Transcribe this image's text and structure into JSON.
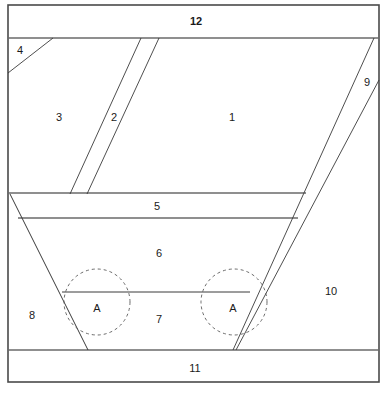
{
  "diagram": {
    "type": "line-diagram",
    "background_color": "#ffffff",
    "line_color": "#3a3a3a",
    "frame_color": "#4a4a4a",
    "dashed_color": "#5a5a5a",
    "labels": [
      {
        "id": "label-12",
        "text": "12",
        "x": 196,
        "y": 22
      },
      {
        "id": "label-4",
        "text": "4",
        "x": 20,
        "y": 51
      },
      {
        "id": "label-3",
        "text": "3",
        "x": 59,
        "y": 118
      },
      {
        "id": "label-2",
        "text": "2",
        "x": 114,
        "y": 118
      },
      {
        "id": "label-1",
        "text": "1",
        "x": 232,
        "y": 118
      },
      {
        "id": "label-9",
        "text": "9",
        "x": 367,
        "y": 83
      },
      {
        "id": "label-5",
        "text": "5",
        "x": 157,
        "y": 207
      },
      {
        "id": "label-6",
        "text": "6",
        "x": 159,
        "y": 254
      },
      {
        "id": "label-10",
        "text": "10",
        "x": 331,
        "y": 292
      },
      {
        "id": "label-A-left",
        "text": "A",
        "x": 97,
        "y": 309
      },
      {
        "id": "label-8",
        "text": "8",
        "x": 32,
        "y": 316
      },
      {
        "id": "label-7",
        "text": "7",
        "x": 159,
        "y": 320
      },
      {
        "id": "label-A-right",
        "text": "A",
        "x": 233,
        "y": 309
      },
      {
        "id": "label-11",
        "text": "11",
        "x": 195,
        "y": 369
      }
    ],
    "frame": {
      "name": "outer-border",
      "x": 8,
      "y": 5,
      "width": 371,
      "height": 377
    },
    "horizontals": [
      {
        "id": "top-band-divider",
        "x1": 8,
        "y1": 38,
        "x2": 379,
        "y2": 38
      },
      {
        "id": "mid-upper-divider",
        "x1": 8,
        "y1": 193,
        "x2": 305,
        "y2": 193
      },
      {
        "id": "band-5-lower",
        "x1": 18,
        "y1": 218,
        "x2": 297,
        "y2": 218
      },
      {
        "id": "band-6-lower",
        "x1": 62,
        "y1": 292,
        "x2": 250,
        "y2": 292
      },
      {
        "id": "bottom-band-divider",
        "x1": 8,
        "y1": 350,
        "x2": 379,
        "y2": 350
      }
    ],
    "diagonals": [
      {
        "id": "line-4-hypotenuse",
        "x1": 53,
        "y1": 38,
        "x2": 8,
        "y2": 73
      },
      {
        "id": "strip-2-left",
        "x1": 141,
        "y1": 38,
        "x2": 70,
        "y2": 193
      },
      {
        "id": "strip-2-right",
        "x1": 159,
        "y1": 38,
        "x2": 87,
        "y2": 193
      },
      {
        "id": "strip-9-left",
        "x1": 374,
        "y1": 38,
        "x2": 233,
        "y2": 350
      },
      {
        "id": "strip-9-right",
        "x1": 379,
        "y1": 80,
        "x2": 236,
        "y2": 350
      },
      {
        "id": "left-flank",
        "x1": 10,
        "y1": 194,
        "x2": 88,
        "y2": 350
      }
    ],
    "circles": [
      {
        "id": "circle-A-left",
        "cx": 97,
        "cy": 302,
        "r": 33
      },
      {
        "id": "circle-A-right",
        "cx": 234,
        "cy": 302,
        "r": 33
      }
    ]
  }
}
